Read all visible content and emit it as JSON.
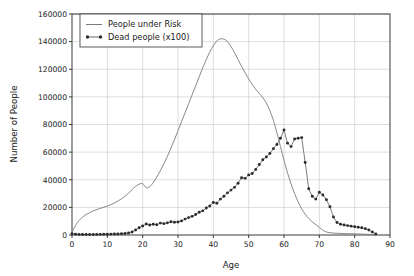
{
  "chart_data": {
    "type": "line",
    "title": "",
    "xlabel": "Age",
    "ylabel": "Number of People",
    "xlim": [
      0,
      90
    ],
    "ylim": [
      0,
      160000
    ],
    "xticks": [
      0,
      10,
      20,
      30,
      40,
      50,
      60,
      70,
      80,
      90
    ],
    "yticks": [
      0,
      20000,
      40000,
      60000,
      80000,
      100000,
      120000,
      140000,
      160000
    ],
    "grid": true,
    "legend_position": "upper-left-inside",
    "colors": {
      "people_under_risk": "#7a7a7a",
      "dead_people": "#2b2b2b",
      "grid": "#cfcfcf",
      "axis": "#3b3b3b",
      "background": "#ffffff"
    },
    "x": [
      0,
      1,
      2,
      3,
      4,
      5,
      6,
      7,
      8,
      9,
      10,
      11,
      12,
      13,
      14,
      15,
      16,
      17,
      18,
      19,
      20,
      21,
      22,
      23,
      24,
      25,
      26,
      27,
      28,
      29,
      30,
      31,
      32,
      33,
      34,
      35,
      36,
      37,
      38,
      39,
      40,
      41,
      42,
      43,
      44,
      45,
      46,
      47,
      48,
      49,
      50,
      51,
      52,
      53,
      54,
      55,
      56,
      57,
      58,
      59,
      60,
      61,
      62,
      63,
      64,
      65,
      66,
      67,
      68,
      69,
      70,
      71,
      72,
      73,
      74,
      75,
      76,
      77,
      78,
      79,
      80,
      81,
      82,
      83,
      84,
      85,
      86
    ],
    "series": [
      {
        "name": "People under Risk",
        "marker": "none",
        "values": [
          2000,
          7000,
          10500,
          13000,
          14800,
          16200,
          17400,
          18400,
          19300,
          20100,
          21000,
          22000,
          23200,
          24600,
          26200,
          28000,
          30200,
          32800,
          35200,
          36800,
          37200,
          34200,
          35000,
          38000,
          42000,
          46500,
          51500,
          57000,
          63000,
          69000,
          75500,
          82000,
          88500,
          95000,
          101500,
          108000,
          114500,
          121000,
          127000,
          132500,
          137000,
          140500,
          142000,
          141800,
          140000,
          136500,
          132000,
          127000,
          122000,
          117500,
          113000,
          109000,
          105500,
          102500,
          99500,
          95500,
          90000,
          83000,
          74000,
          64000,
          54000,
          45000,
          37000,
          30000,
          24000,
          19000,
          15000,
          12000,
          9500,
          7500,
          5500,
          3500,
          2200,
          1700,
          1400,
          1250,
          1150,
          1050,
          980,
          900,
          820,
          740,
          660,
          560,
          420,
          250,
          100
        ]
      },
      {
        "name": "Dead people (x100)",
        "marker": "circle",
        "values": [
          900,
          600,
          450,
          400,
          380,
          380,
          400,
          430,
          470,
          520,
          580,
          650,
          720,
          800,
          900,
          1050,
          1400,
          2200,
          3600,
          5200,
          6500,
          8000,
          7200,
          7800,
          7400,
          8600,
          8200,
          8800,
          9600,
          9200,
          9400,
          10200,
          11500,
          12600,
          13500,
          14800,
          16500,
          17500,
          19500,
          21000,
          23500,
          23000,
          26000,
          28000,
          30500,
          32500,
          34500,
          37500,
          41500,
          41000,
          43500,
          44500,
          47500,
          51000,
          54500,
          56500,
          59000,
          62500,
          65500,
          70000,
          76000,
          66500,
          64000,
          69500,
          70000,
          70500,
          52500,
          33500,
          28000,
          26000,
          31000,
          29000,
          25500,
          20500,
          13000,
          9000,
          7800,
          7200,
          6800,
          6400,
          6000,
          5600,
          5200,
          4600,
          3600,
          2200,
          800
        ]
      }
    ]
  },
  "legend": {
    "entries": [
      {
        "label": "People under Risk"
      },
      {
        "label": "Dead people (x100)"
      }
    ]
  },
  "axes": {
    "x_title": "Age",
    "y_title": "Number of People",
    "x_tick_labels": [
      "0",
      "10",
      "20",
      "30",
      "40",
      "50",
      "60",
      "70",
      "80",
      "90"
    ],
    "y_tick_labels": [
      "0",
      "20000",
      "40000",
      "60000",
      "80000",
      "100000",
      "120000",
      "140000",
      "160000"
    ]
  }
}
